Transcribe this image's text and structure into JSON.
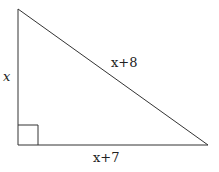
{
  "diagram": {
    "type": "right-triangle",
    "vertices": {
      "top": [
        18,
        9
      ],
      "right_angle": [
        18,
        145
      ],
      "bottom_right": [
        208,
        145
      ]
    },
    "right_angle_marker": true,
    "labels": {
      "left_side": "x",
      "hypotenuse": "x+8",
      "bottom_side": "x+7"
    }
  }
}
